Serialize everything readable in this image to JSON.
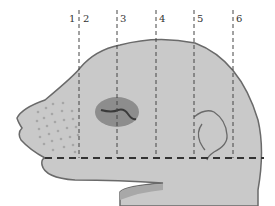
{
  "figure": {
    "colors": {
      "head_fill": "#c9c9c9",
      "head_outline": "#6a6a6a",
      "eye_fill": "#8d8d8d",
      "dashed_line": "#444444",
      "whisker_dots": "#a6a6a6"
    },
    "section_labels": [
      {
        "text": "1",
        "x": 69
      },
      {
        "text": "2",
        "x": 83
      },
      {
        "text": "3",
        "x": 120
      },
      {
        "text": "4",
        "x": 159
      },
      {
        "text": "5",
        "x": 197
      },
      {
        "text": "6",
        "x": 236
      }
    ],
    "vertical_lines_x": [
      79,
      117,
      156,
      194,
      233
    ],
    "horizontal_line_y": 158
  }
}
